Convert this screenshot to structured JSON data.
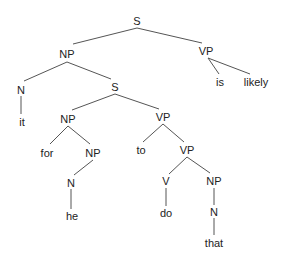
{
  "diagram": {
    "type": "syntax-tree",
    "nodes": [
      {
        "id": "n0",
        "label": "S",
        "x": 137,
        "y": 21
      },
      {
        "id": "n1",
        "label": "NP",
        "x": 67,
        "y": 54
      },
      {
        "id": "n2",
        "label": "VP",
        "x": 206,
        "y": 51
      },
      {
        "id": "n3",
        "label": "is",
        "x": 220,
        "y": 82
      },
      {
        "id": "n4",
        "label": "likely",
        "x": 256,
        "y": 82
      },
      {
        "id": "n5",
        "label": "N",
        "x": 21,
        "y": 90
      },
      {
        "id": "n6",
        "label": "S",
        "x": 115,
        "y": 87
      },
      {
        "id": "n7",
        "label": "it",
        "x": 22,
        "y": 122
      },
      {
        "id": "n8",
        "label": "NP",
        "x": 68,
        "y": 119
      },
      {
        "id": "n9",
        "label": "VP",
        "x": 163,
        "y": 117
      },
      {
        "id": "n10",
        "label": "for",
        "x": 47,
        "y": 153
      },
      {
        "id": "n11",
        "label": "NP",
        "x": 93,
        "y": 153
      },
      {
        "id": "n12",
        "label": "to",
        "x": 141,
        "y": 150
      },
      {
        "id": "n13",
        "label": "VP",
        "x": 187,
        "y": 150
      },
      {
        "id": "n14",
        "label": "N",
        "x": 71,
        "y": 183
      },
      {
        "id": "n15",
        "label": "V",
        "x": 166,
        "y": 181
      },
      {
        "id": "n16",
        "label": "NP",
        "x": 214,
        "y": 181
      },
      {
        "id": "n17",
        "label": "he",
        "x": 72,
        "y": 216
      },
      {
        "id": "n18",
        "label": "do",
        "x": 166,
        "y": 213
      },
      {
        "id": "n19",
        "label": "N",
        "x": 214,
        "y": 212
      },
      {
        "id": "n20",
        "label": "that",
        "x": 214,
        "y": 243
      }
    ],
    "edges": [
      {
        "from": [
          137,
          28
        ],
        "to": [
          73,
          44
        ]
      },
      {
        "from": [
          137,
          28
        ],
        "to": [
          202,
          43
        ]
      },
      {
        "from": [
          208,
          58
        ],
        "to": [
          219,
          74
        ]
      },
      {
        "from": [
          208,
          58
        ],
        "to": [
          250,
          74
        ]
      },
      {
        "from": [
          67,
          62
        ],
        "to": [
          24,
          81
        ]
      },
      {
        "from": [
          67,
          62
        ],
        "to": [
          111,
          79
        ]
      },
      {
        "from": [
          21,
          96
        ],
        "to": [
          21,
          114
        ]
      },
      {
        "from": [
          115,
          94
        ],
        "to": [
          72,
          110
        ]
      },
      {
        "from": [
          115,
          94
        ],
        "to": [
          159,
          109
        ]
      },
      {
        "from": [
          68,
          126
        ],
        "to": [
          50,
          144
        ]
      },
      {
        "from": [
          68,
          126
        ],
        "to": [
          90,
          144
        ]
      },
      {
        "from": [
          163,
          124
        ],
        "to": [
          143,
          142
        ]
      },
      {
        "from": [
          163,
          124
        ],
        "to": [
          184,
          142
        ]
      },
      {
        "from": [
          93,
          160
        ],
        "to": [
          74,
          175
        ]
      },
      {
        "from": [
          71,
          189
        ],
        "to": [
          71,
          209
        ]
      },
      {
        "from": [
          187,
          157
        ],
        "to": [
          169,
          174
        ]
      },
      {
        "from": [
          187,
          157
        ],
        "to": [
          210,
          173
        ]
      },
      {
        "from": [
          166,
          188
        ],
        "to": [
          166,
          206
        ]
      },
      {
        "from": [
          214,
          188
        ],
        "to": [
          214,
          205
        ]
      },
      {
        "from": [
          214,
          218
        ],
        "to": [
          214,
          235
        ]
      }
    ]
  }
}
